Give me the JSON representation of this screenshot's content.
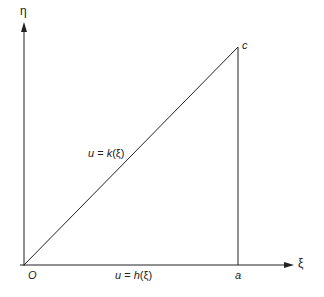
{
  "axes": {
    "x_label": "ξ",
    "y_label": "η",
    "origin_label": "O"
  },
  "points": {
    "a_label": "a",
    "c_label": "c"
  },
  "curves": {
    "upper": {
      "var": "u",
      "eq": " = ",
      "func": "k",
      "arg": "(ξ)"
    },
    "lower": {
      "var": "u",
      "eq": " = ",
      "func": "h",
      "arg": "(ξ)"
    }
  },
  "colors": {
    "line": "#222222"
  }
}
